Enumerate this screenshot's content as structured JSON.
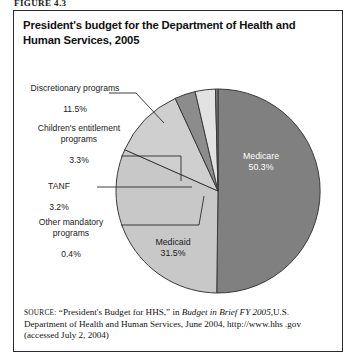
{
  "figure_label": "FIGURE 4.3",
  "title": "President's budget for the Department of Health and Human Services, 2005",
  "source": {
    "prefix": "SOURCE:",
    "quoted": "“President's Budget for HHS,”",
    "in_word": "in",
    "italic_title": "Budget in Brief FY 2005,",
    "rest": "U.S. Department of Health and Human Services, June 2004, http://www.hhs .gov (accessed July 2, 2004)"
  },
  "colors": {
    "medicare": "#808080",
    "medicaid": "#c8c8c8",
    "discretionary": "#cfcfcf",
    "childrens": "#8c8c8c",
    "tanf": "#e2e2e2",
    "other_mandatory": "#7a7a7a",
    "outline": "#3a3a3a",
    "border": "#2b2b2b",
    "text_dark": "#1b1b1b",
    "text_light": "#ffffff"
  },
  "chart_data": {
    "type": "pie",
    "title": "President's budget for the Department of Health and Human Services, 2005",
    "unit": "percent",
    "total": 100.2,
    "legend": "none",
    "labels_inside": [
      "Medicare",
      "Medicaid"
    ],
    "labels_callout": [
      "Discretionary programs",
      "Children's entitlement programs",
      "TANF",
      "Other mandatory programs"
    ],
    "categories": [
      "Medicare",
      "Medicaid",
      "Discretionary programs",
      "Children's entitlement programs",
      "TANF",
      "Other mandatory programs"
    ],
    "values": [
      50.3,
      31.5,
      11.5,
      3.3,
      3.2,
      0.4
    ],
    "slices": [
      {
        "name": "Medicare",
        "value": 50.3,
        "value_label": "50.3%",
        "color": "#808080",
        "label_placement": "inside",
        "label_color": "#ffffff"
      },
      {
        "name": "Medicaid",
        "value": 31.5,
        "value_label": "31.5%",
        "color": "#c8c8c8",
        "label_placement": "inside",
        "label_color": "#1b1b1b"
      },
      {
        "name": "Discretionary programs",
        "value": 11.5,
        "value_label": "11.5%",
        "color": "#cfcfcf",
        "label_placement": "callout",
        "label_color": "#1b1b1b"
      },
      {
        "name": "Children's entitlement programs",
        "value": 3.3,
        "value_label": "3.3%",
        "color": "#8c8c8c",
        "label_placement": "callout",
        "label_color": "#1b1b1b"
      },
      {
        "name": "TANF",
        "value": 3.2,
        "value_label": "3.2%",
        "color": "#e2e2e2",
        "label_placement": "callout",
        "label_color": "#1b1b1b"
      },
      {
        "name": "Other mandatory programs",
        "value": 0.4,
        "value_label": "0.4%",
        "color": "#7a7a7a",
        "label_placement": "callout",
        "label_color": "#1b1b1b"
      }
    ]
  },
  "callouts": {
    "discretionary": {
      "name": "Discretionary programs",
      "pct": "11.5%"
    },
    "childrens": {
      "name": "Children's entitlement\nprograms",
      "pct": "3.3%"
    },
    "tanf": {
      "name": "TANF",
      "pct": "3.2%"
    },
    "other": {
      "name": "Other mandatory\nprograms",
      "pct": "0.4%"
    }
  },
  "inside": {
    "medicare": {
      "name": "Medicare",
      "pct": "50.3%"
    },
    "medicaid": {
      "name": "Medicaid",
      "pct": "31.5%"
    }
  }
}
